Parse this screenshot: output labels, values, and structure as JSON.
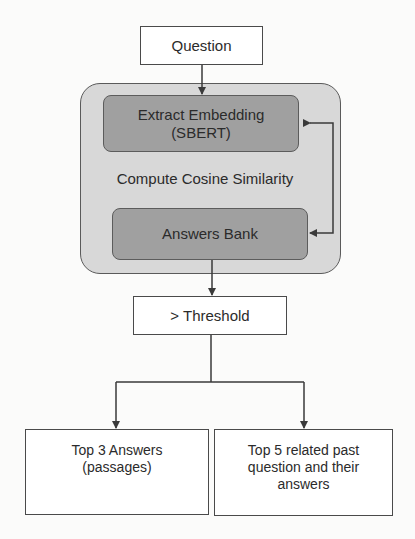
{
  "diagram": {
    "type": "flowchart",
    "nodes": {
      "question": {
        "label": "Question"
      },
      "similarity_group": {
        "label": "Compute Cosine Similarity"
      },
      "extract_embedding": {
        "label_line1": "Extract Embedding",
        "label_line2": "(SBERT)"
      },
      "answers_bank": {
        "label": "Answers Bank"
      },
      "threshold": {
        "label": "> Threshold"
      },
      "top_answers": {
        "label_line1": "Top 3 Answers",
        "label_line2": "(passages)"
      },
      "related_questions": {
        "label_line1": "Top 5 related past",
        "label_line2": "question and their",
        "label_line3": "answers"
      }
    },
    "edges": [
      {
        "from": "question",
        "to": "extract_embedding"
      },
      {
        "from": "answers_bank",
        "to": "extract_embedding",
        "bidirectional": true
      },
      {
        "from": "answers_bank",
        "to": "threshold"
      },
      {
        "from": "threshold",
        "to": "top_answers"
      },
      {
        "from": "threshold",
        "to": "related_questions"
      }
    ],
    "colors": {
      "outer_group_fill": "#d8d8d8",
      "inner_box_fill": "#a0a0a0",
      "plain_box_fill": "#ffffff",
      "stroke": "#4a4a4a",
      "text": "#2b2b2b"
    }
  }
}
